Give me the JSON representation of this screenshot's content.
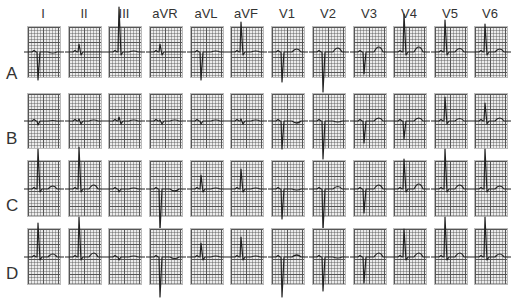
{
  "leads": [
    "I",
    "II",
    "III",
    "aVR",
    "aVL",
    "aVF",
    "V1",
    "V2",
    "V3",
    "V4",
    "V5",
    "V6"
  ],
  "rows": [
    {
      "label": "A",
      "top": 26,
      "height": 50
    },
    {
      "label": "B",
      "top": 93,
      "height": 54
    },
    {
      "label": "C",
      "top": 160,
      "height": 55
    },
    {
      "label": "D",
      "top": 228,
      "height": 55
    }
  ],
  "columns_x": [
    27,
    68,
    108,
    149,
    190,
    230,
    271,
    312,
    353,
    393,
    434,
    474
  ],
  "colors": {
    "grid_major": "#555555",
    "grid_bg": "#ececec",
    "trace": "#222222",
    "label": "#333333"
  }
}
